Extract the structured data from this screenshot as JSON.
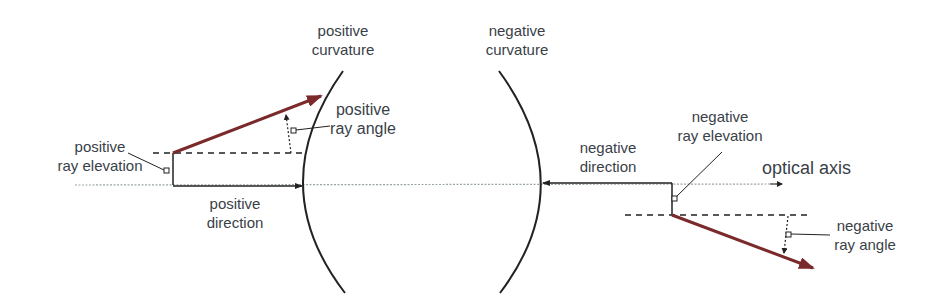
{
  "labels": {
    "positive_curvature": [
      "positive",
      "curvature"
    ],
    "negative_curvature": [
      "negative",
      "curvature"
    ],
    "positive_ray_angle": [
      "positive",
      "ray angle"
    ],
    "positive_ray_elevation": [
      "positive",
      "ray elevation"
    ],
    "positive_direction": [
      "positive",
      "direction"
    ],
    "negative_direction": [
      "negative",
      "direction"
    ],
    "negative_ray_elevation": [
      "negative",
      "ray elevation"
    ],
    "optical_axis": "optical axis",
    "negative_ray_angle": [
      "negative",
      "ray angle"
    ]
  },
  "colors": {
    "ray": "#7a2a2a",
    "line": "#222222",
    "axis": "#9aa6a0",
    "text": "#3a3f48"
  }
}
